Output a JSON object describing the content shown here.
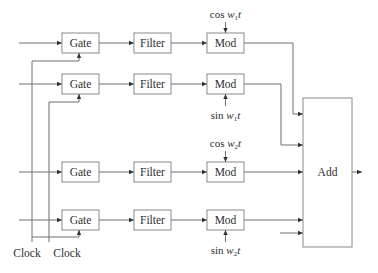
{
  "diagram": {
    "type": "block-diagram",
    "channels": [
      {
        "gate": "Gate",
        "filter": "Filter",
        "mod": "Mod",
        "carrier": {
          "func": "cos",
          "var": "w",
          "sub": "1",
          "t": "t"
        },
        "carrier_position": "above"
      },
      {
        "gate": "Gate",
        "filter": "Filter",
        "mod": "Mod",
        "carrier": {
          "func": "sin",
          "var": "w",
          "sub": "1",
          "t": "t"
        },
        "carrier_position": "below"
      },
      {
        "gate": "Gate",
        "filter": "Filter",
        "mod": "Mod",
        "carrier": {
          "func": "cos",
          "var": "w",
          "sub": "2",
          "t": "t"
        },
        "carrier_position": "above"
      },
      {
        "gate": "Gate",
        "filter": "Filter",
        "mod": "Mod",
        "carrier": {
          "func": "sin",
          "var": "w",
          "sub": "2",
          "t": "t"
        },
        "carrier_position": "below"
      }
    ],
    "adder": {
      "label": "Add"
    },
    "clocks": [
      {
        "label": "Clock"
      },
      {
        "label": "Clock"
      }
    ],
    "colors": {
      "line": "#6e6e6e",
      "box_border": "#8a8a8a",
      "text": "#2e2e2e",
      "background": "#ffffff"
    }
  }
}
